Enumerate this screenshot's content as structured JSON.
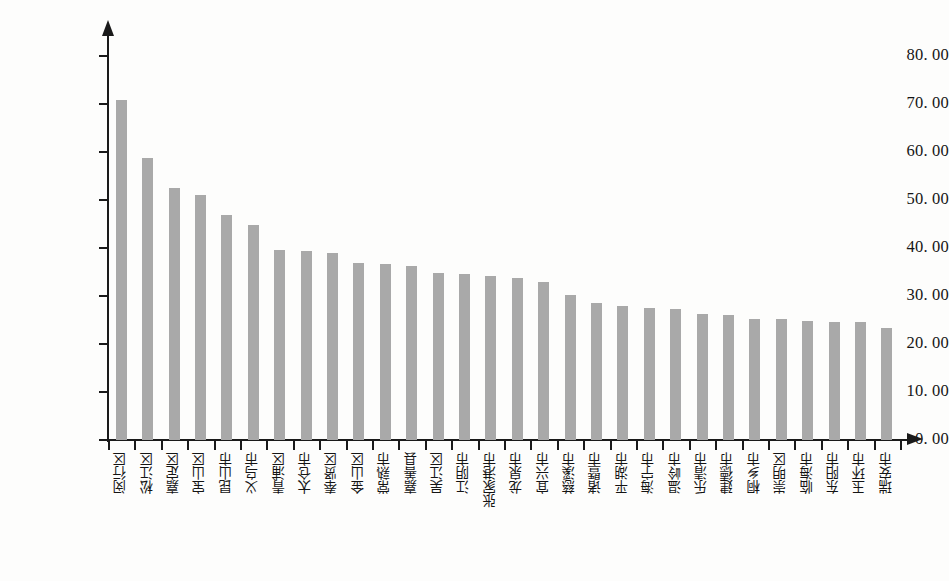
{
  "chart_data": {
    "type": "bar",
    "title": "",
    "subtitle": "",
    "xlabel": "",
    "ylabel": "",
    "ylim": [
      0,
      80
    ],
    "ytick_step": 10,
    "grid": false,
    "legend": null,
    "bar_color": "#a9a9a9",
    "axis_color": "#1a1a1a",
    "ytick_labels": [
      "0. 00",
      "10. 00",
      "20. 00",
      "30. 00",
      "40. 00",
      "50. 00",
      "60. 00",
      "70. 00",
      "80. 00"
    ],
    "ytick_values": [
      0,
      10,
      20,
      30,
      40,
      50,
      60,
      70,
      80
    ],
    "categories": [
      "闵行区",
      "松江区",
      "嘉定区",
      "宝山区",
      "昆山市",
      "义乌市",
      "青浦区",
      "太仓市",
      "奉贤区",
      "金山区",
      "常熟市",
      "嘉善县",
      "吴江区",
      "江阴市",
      "张家港市",
      "龙泉市",
      "宜兴市",
      "慈溪市",
      "诸暨市",
      "平湖市",
      "海宁市",
      "温岭市",
      "乐清市",
      "建德市",
      "桐乡市",
      "崇明区",
      "临海市",
      "东阳市",
      "玉环市",
      "瑞安市"
    ],
    "values": [
      70.8,
      58.8,
      52.5,
      51.0,
      46.9,
      44.8,
      39.6,
      39.4,
      38.9,
      36.9,
      36.7,
      36.3,
      34.8,
      34.6,
      34.2,
      33.8,
      32.9,
      30.2,
      28.6,
      28.0,
      27.6,
      27.3,
      26.3,
      26.0,
      25.2,
      25.2,
      24.7,
      24.6,
      24.6,
      23.4
    ]
  }
}
